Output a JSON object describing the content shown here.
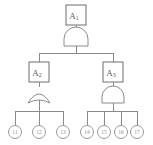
{
  "diagram": {
    "colors": {
      "background": "#ffffff",
      "edge": "#8a8a8a",
      "box_stroke": "#6f6f6f",
      "circle_stroke": "#9a9a9a",
      "label_text": "#5a5a5a",
      "leaf_text": "#8f8f8f"
    },
    "nodes": [
      {
        "id": "A1",
        "base": "A",
        "subscript": "1",
        "shape": "rectangle",
        "gate": "AND",
        "x": 76,
        "y": 15
      },
      {
        "id": "A2",
        "base": "A",
        "subscript": "2",
        "shape": "rectangle",
        "gate": "OR",
        "x": 39,
        "y": 72
      },
      {
        "id": "A3",
        "base": "A",
        "subscript": "3",
        "shape": "rectangle",
        "gate": "AND",
        "x": 113,
        "y": 72
      }
    ],
    "leaves": [
      {
        "id": "11",
        "label": "11",
        "x": 15,
        "y": 132,
        "parent": "A2"
      },
      {
        "id": "12",
        "label": "12",
        "x": 39,
        "y": 132,
        "parent": "A2"
      },
      {
        "id": "13",
        "label": "13",
        "x": 63,
        "y": 132,
        "parent": "A2"
      },
      {
        "id": "14",
        "label": "14",
        "x": 87,
        "y": 132,
        "parent": "A3"
      },
      {
        "id": "15",
        "label": "15",
        "x": 104,
        "y": 132,
        "parent": "A3"
      },
      {
        "id": "16",
        "label": "16",
        "x": 121,
        "y": 132,
        "parent": "A3"
      },
      {
        "id": "17",
        "label": "17",
        "x": 137,
        "y": 132,
        "parent": "A3"
      }
    ],
    "gates": [
      {
        "id": "gate-A1",
        "type": "AND",
        "owner": "A1",
        "cx": 76,
        "cy": 39
      },
      {
        "id": "gate-A2",
        "type": "OR",
        "owner": "A2",
        "cx": 39,
        "cy": 96
      },
      {
        "id": "gate-A3",
        "type": "AND",
        "owner": "A3",
        "cx": 113,
        "cy": 96
      }
    ]
  }
}
